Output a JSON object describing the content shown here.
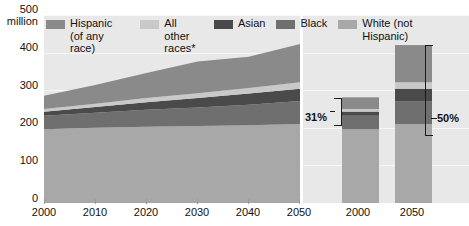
{
  "chart_data": {
    "type": "area",
    "title": "",
    "xlabel": "",
    "ylabel": "500 million",
    "ylim": [
      0,
      500
    ],
    "grid": true,
    "legend_position": "top-inside",
    "y_ticks": [
      "500",
      "400",
      "300",
      "200",
      "100",
      "0"
    ],
    "y_unit": "million",
    "x": [
      2000,
      2010,
      2020,
      2030,
      2040,
      2050
    ],
    "x_tick_labels": [
      "2000",
      "2010",
      "2020",
      "2030",
      "2040",
      "2050"
    ],
    "series": [
      {
        "name": "White (not Hispanic)",
        "color": "#a8a8a8",
        "values": [
          196,
          200,
          203,
          205,
          207,
          210
        ]
      },
      {
        "name": "Black",
        "color": "#6f6f6f",
        "values": [
          36,
          40,
          45,
          49,
          54,
          61
        ]
      },
      {
        "name": "Asian",
        "color": "#4a4a4a",
        "values": [
          11,
          15,
          20,
          25,
          30,
          33
        ]
      },
      {
        "name": "All other races*",
        "color": "#c9c9c9",
        "values": [
          7,
          9,
          11,
          13,
          15,
          17
        ]
      },
      {
        "name": "Hispanic (of any race)",
        "color": "#8a8a8a",
        "values": [
          35,
          50,
          67,
          84,
          83,
          102
        ]
      }
    ],
    "bars": {
      "categories": [
        "2000",
        "2050"
      ],
      "totals": [
        281,
        420
      ],
      "stacks": [
        {
          "year": "2000",
          "segments": [
            {
              "name": "White (not Hispanic)",
              "color": "#a8a8a8",
              "value": 196
            },
            {
              "name": "Black",
              "color": "#6f6f6f",
              "value": 36
            },
            {
              "name": "Asian",
              "color": "#4a4a4a",
              "value": 11
            },
            {
              "name": "All other races*",
              "color": "#c9c9c9",
              "value": 7
            },
            {
              "name": "Hispanic (of any race)",
              "color": "#8a8a8a",
              "value": 31
            }
          ]
        },
        {
          "year": "2050",
          "segments": [
            {
              "name": "White (not Hispanic)",
              "color": "#a8a8a8",
              "value": 210
            },
            {
              "name": "Black",
              "color": "#6f6f6f",
              "value": 61
            },
            {
              "name": "Asian",
              "color": "#4a4a4a",
              "value": 33
            },
            {
              "name": "All other races*",
              "color": "#c9c9c9",
              "value": 17
            },
            {
              "name": "Hispanic (of any race)",
              "color": "#8a8a8a",
              "value": 99
            }
          ]
        }
      ]
    },
    "annotations": [
      {
        "label": "31%",
        "refers_to": "2000 non-white share"
      },
      {
        "label": "50%",
        "refers_to": "2050 non-white share"
      }
    ]
  },
  "legend": {
    "items": [
      {
        "label": "Hispanic\n(of any race)",
        "color": "#8a8a8a",
        "icon": "legend-swatch-hispanic"
      },
      {
        "label": "All other\nraces*",
        "color": "#c9c9c9",
        "icon": "legend-swatch-all-other-races"
      },
      {
        "label": "Asian",
        "color": "#4a4a4a",
        "icon": "legend-swatch-asian"
      },
      {
        "label": "Black",
        "color": "#6f6f6f",
        "icon": "legend-swatch-black"
      },
      {
        "label": "White (not Hispanic)",
        "color": "#a8a8a8",
        "icon": "legend-swatch-white"
      }
    ]
  },
  "axis": {
    "y_top_label": "500",
    "y_unit_label": "million",
    "y_400": "400",
    "y_300": "300",
    "y_200": "200",
    "y_100": "100",
    "y_0": "0",
    "x_2000": "2000",
    "x_2010": "2010",
    "x_2020": "2020",
    "x_2030": "2030",
    "x_2040": "2040",
    "x_2050": "2050",
    "bar_2000": "2000",
    "bar_2050": "2050"
  },
  "annotations": {
    "pct_2000": "31%",
    "pct_2050": "50%"
  },
  "colors": {
    "panel_background": "#e8e8e8",
    "gridline": "#f7f7f7",
    "text": "#111111",
    "bracket": "#1a1a1a"
  }
}
